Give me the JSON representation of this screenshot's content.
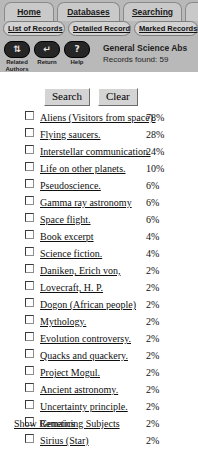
{
  "nav": {
    "tabs": [
      {
        "label": "Home",
        "name": "tab-home"
      },
      {
        "label": "Databases",
        "name": "tab-databases"
      },
      {
        "label": "Searching",
        "name": "tab-searching"
      },
      {
        "label": "",
        "name": "tab-overflow"
      }
    ],
    "subtabs": [
      {
        "label": "List of Records",
        "name": "subtab-list-of-records"
      },
      {
        "label": "Detailed Record",
        "name": "subtab-detailed-record"
      },
      {
        "label": "Marked Records",
        "name": "subtab-marked-records"
      }
    ]
  },
  "toolbar": {
    "items": [
      {
        "caption": "Related Authors",
        "icon": "related-authors-icon",
        "glyph": "⇅"
      },
      {
        "caption": "Return",
        "icon": "return-arrow-icon",
        "glyph": "↵"
      },
      {
        "caption": "Help",
        "icon": "question-mark-icon",
        "glyph": "?"
      }
    ]
  },
  "database": {
    "name": "General Science Abs",
    "records_found_label": "Records found: 59"
  },
  "buttons": {
    "search": "Search",
    "clear": "Clear"
  },
  "subjects": [
    {
      "label": "Aliens (Visitors from space).",
      "percent": "78%"
    },
    {
      "label": "Flying saucers.",
      "percent": "28%"
    },
    {
      "label": "Interstellar communication.",
      "percent": "24%"
    },
    {
      "label": "Life on other planets.",
      "percent": "10%"
    },
    {
      "label": "Pseudoscience.",
      "percent": "6%"
    },
    {
      "label": "Gamma ray astronomy",
      "percent": "6%"
    },
    {
      "label": "Space flight.",
      "percent": "6%"
    },
    {
      "label": "Book excerpt",
      "percent": "4%"
    },
    {
      "label": "Science fiction.",
      "percent": "4%"
    },
    {
      "label": "Daniken, Erich von,",
      "percent": "2%"
    },
    {
      "label": "Lovecraft, H. P.",
      "percent": "2%"
    },
    {
      "label": "Dogon (African people)",
      "percent": "2%"
    },
    {
      "label": "Mythology.",
      "percent": "2%"
    },
    {
      "label": "Evolution controversy.",
      "percent": "2%"
    },
    {
      "label": "Quacks and quackery.",
      "percent": "2%"
    },
    {
      "label": "Project Mogul.",
      "percent": "2%"
    },
    {
      "label": "Ancient astronomy.",
      "percent": "2%"
    },
    {
      "label": "Uncertainty principle.",
      "percent": "2%"
    },
    {
      "label": "Genetics",
      "percent": "2%"
    },
    {
      "label": "Sirius (Star)",
      "percent": "2%"
    }
  ],
  "footer": {
    "show_remaining": "Show Remaining Subjects"
  },
  "colors": {
    "banner_bg": "#b9b9b9",
    "tab_bg": "#c9c9c9",
    "subtab_bg": "#d2d2d2",
    "icon_pill": "#262626",
    "page_bg": "#ffffff"
  }
}
